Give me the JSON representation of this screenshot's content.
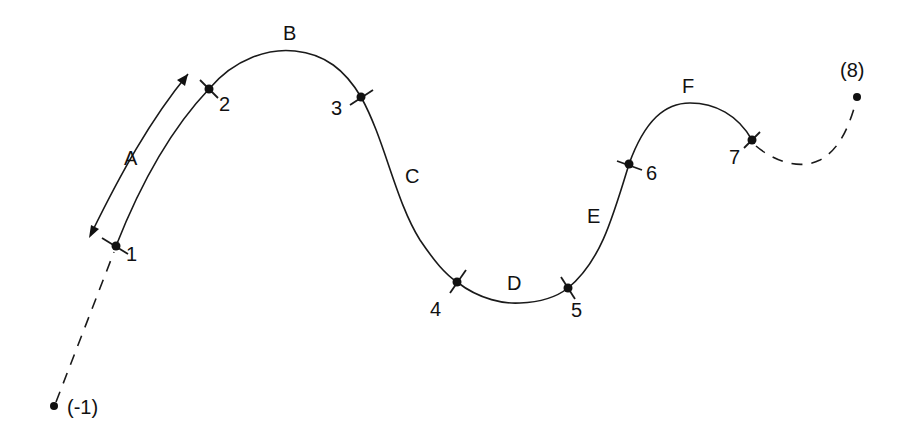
{
  "diagram": {
    "title": "",
    "colors": {
      "stroke": "#1a1a1a",
      "background": "#ffffff"
    },
    "points": [
      {
        "id": "pm1",
        "label": "(-1)",
        "x": 54,
        "y": 406,
        "type": "phantom"
      },
      {
        "id": "p1",
        "label": "1",
        "x": 116,
        "y": 246,
        "type": "knot"
      },
      {
        "id": "p2",
        "label": "2",
        "x": 209,
        "y": 89,
        "type": "knot"
      },
      {
        "id": "p3",
        "label": "3",
        "x": 361,
        "y": 97,
        "type": "knot"
      },
      {
        "id": "p4",
        "label": "4",
        "x": 457,
        "y": 282,
        "type": "knot"
      },
      {
        "id": "p5",
        "label": "5",
        "x": 568,
        "y": 288,
        "type": "knot"
      },
      {
        "id": "p6",
        "label": "6",
        "x": 629,
        "y": 164,
        "type": "knot"
      },
      {
        "id": "p7",
        "label": "7",
        "x": 752,
        "y": 140,
        "type": "knot"
      },
      {
        "id": "p8",
        "label": "(8)",
        "x": 857,
        "y": 97,
        "type": "phantom"
      }
    ],
    "segments": [
      {
        "label": "A",
        "from": "1",
        "to": "2"
      },
      {
        "label": "B",
        "from": "2",
        "to": "3"
      },
      {
        "label": "C",
        "from": "3",
        "to": "4"
      },
      {
        "label": "D",
        "from": "4",
        "to": "5"
      },
      {
        "label": "E",
        "from": "5",
        "to": "6"
      },
      {
        "label": "F",
        "from": "6",
        "to": "7"
      }
    ],
    "labels": {
      "pm1": "(-1)",
      "p1": "1",
      "p2": "2",
      "p3": "3",
      "p4": "4",
      "p5": "5",
      "p6": "6",
      "p7": "7",
      "p8": "(8)",
      "A": "A",
      "B": "B",
      "C": "C",
      "D": "D",
      "E": "E",
      "F": "F"
    },
    "annotations": [
      {
        "type": "double-arrow",
        "along": "A",
        "meaning": "extent of segment A"
      }
    ]
  }
}
